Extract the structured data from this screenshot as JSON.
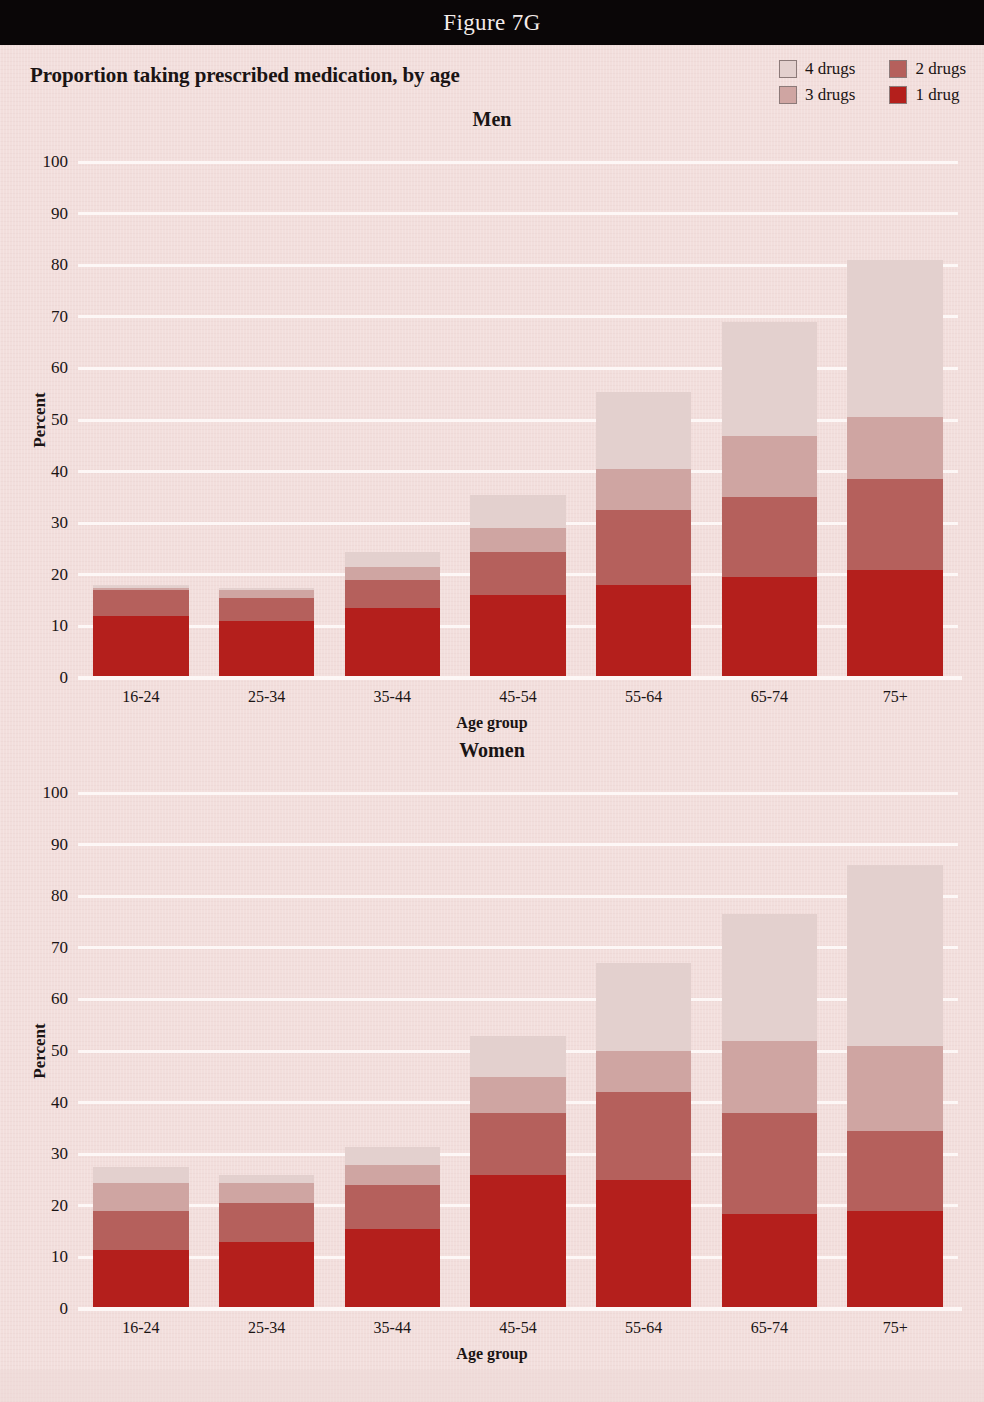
{
  "figure": {
    "bar_label": "Figure 7G",
    "bar_color": "#0a0607"
  },
  "header": {
    "title": "Proportion taking prescribed medication, by age"
  },
  "legend": {
    "items": [
      {
        "label": "4 drugs",
        "color": "#e3d0ce"
      },
      {
        "label": "2 drugs",
        "color": "#b5605c"
      },
      {
        "label": "3 drugs",
        "color": "#cfa5a2"
      },
      {
        "label": "1 drug",
        "color": "#b41f1c"
      }
    ]
  },
  "panels": [
    {
      "id": "men",
      "title": "Men"
    },
    {
      "id": "women",
      "title": "Women"
    }
  ],
  "axes": {
    "y_title": "Percent",
    "x_title": "Age group",
    "y_ticks": [
      "100",
      "90",
      "80",
      "70",
      "60",
      "50",
      "40",
      "30",
      "20",
      "10",
      "0"
    ],
    "x_ticks": [
      "16-24",
      "25-34",
      "35-44",
      "45-54",
      "55-64",
      "65-74",
      "75+"
    ]
  },
  "chart_data": [
    {
      "type": "bar",
      "id": "men",
      "title": "Men",
      "subtitle": "Proportion taking prescribed medication, by age",
      "xlabel": "Age group",
      "ylabel": "Percent",
      "ylim": [
        0,
        100
      ],
      "ytick_step": 10,
      "grid": true,
      "stacked": true,
      "legend_position": "top-right",
      "categories": [
        "16-24",
        "25-34",
        "35-44",
        "45-54",
        "55-64",
        "65-74",
        "75+"
      ],
      "series": [
        {
          "name": "1 drug",
          "color": "#b41f1c",
          "values": [
            12.0,
            11.0,
            13.5,
            16.0,
            18.0,
            19.5,
            21.0
          ]
        },
        {
          "name": "2 drugs",
          "color": "#b5605c",
          "values": [
            5.0,
            4.5,
            5.5,
            8.5,
            14.5,
            15.5,
            17.5
          ]
        },
        {
          "name": "3 drugs",
          "color": "#cfa5a2",
          "values": [
            0.5,
            1.5,
            2.5,
            4.5,
            8.0,
            12.0,
            12.0
          ]
        },
        {
          "name": "4 drugs",
          "color": "#e3d0ce",
          "values": [
            0.5,
            0.5,
            3.0,
            6.5,
            15.0,
            22.0,
            30.5
          ]
        }
      ],
      "totals": [
        18.0,
        17.5,
        24.5,
        35.5,
        55.5,
        69.0,
        81.0
      ]
    },
    {
      "type": "bar",
      "id": "women",
      "title": "Women",
      "subtitle": "Proportion taking prescribed medication, by age",
      "xlabel": "Age group",
      "ylabel": "Percent",
      "ylim": [
        0,
        100
      ],
      "ytick_step": 10,
      "grid": true,
      "stacked": true,
      "legend_position": "top-right",
      "categories": [
        "16-24",
        "25-34",
        "35-44",
        "45-54",
        "55-64",
        "65-74",
        "75+"
      ],
      "series": [
        {
          "name": "1 drug",
          "color": "#b41f1c",
          "values": [
            11.5,
            13.0,
            15.5,
            26.0,
            25.0,
            18.5,
            19.0
          ]
        },
        {
          "name": "2 drugs",
          "color": "#b5605c",
          "values": [
            7.5,
            7.5,
            8.5,
            12.0,
            17.0,
            19.5,
            15.5
          ]
        },
        {
          "name": "3 drugs",
          "color": "#cfa5a2",
          "values": [
            5.5,
            4.0,
            4.0,
            7.0,
            8.0,
            14.0,
            16.5
          ]
        },
        {
          "name": "4 drugs",
          "color": "#e3d0ce",
          "values": [
            3.0,
            1.5,
            3.5,
            8.0,
            17.0,
            24.5,
            35.0
          ]
        }
      ],
      "totals": [
        27.5,
        26.0,
        31.5,
        53.0,
        67.0,
        76.5,
        86.0
      ]
    }
  ]
}
